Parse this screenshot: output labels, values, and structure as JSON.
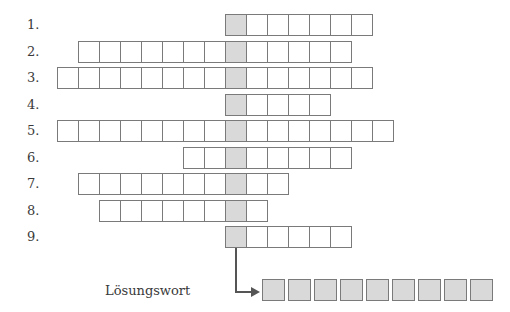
{
  "puzzle": {
    "type": "crossword",
    "key_column_color": "#d9d9d9",
    "cell_border_color": "#7a7a7a",
    "rows": [
      {
        "label": "1.",
        "cells_left": 0,
        "cells_right": 6
      },
      {
        "label": "2.",
        "cells_left": 7,
        "cells_right": 5
      },
      {
        "label": "3.",
        "cells_left": 8,
        "cells_right": 6
      },
      {
        "label": "4.",
        "cells_left": 0,
        "cells_right": 4
      },
      {
        "label": "5.",
        "cells_left": 8,
        "cells_right": 7
      },
      {
        "label": "6.",
        "cells_left": 2,
        "cells_right": 5
      },
      {
        "label": "7.",
        "cells_left": 7,
        "cells_right": 2
      },
      {
        "label": "8.",
        "cells_left": 6,
        "cells_right": 1
      },
      {
        "label": "9.",
        "cells_left": 0,
        "cells_right": 5
      }
    ]
  },
  "solution": {
    "label": "Lösungswort",
    "cell_count": 9
  }
}
